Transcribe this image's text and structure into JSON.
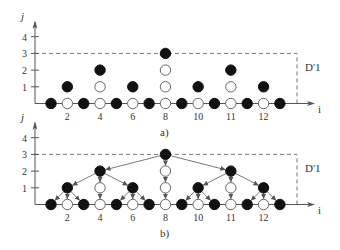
{
  "figure": {
    "panels": [
      {
        "id": "a",
        "caption": "a)",
        "y_axis_label": "j",
        "x_axis_label": "i",
        "region_label": "D'1",
        "y_ticks": [
          "1",
          "2",
          "3",
          "4"
        ],
        "x_ticks": [
          {
            "col": 1,
            "label": "2"
          },
          {
            "col": 3,
            "label": "4"
          },
          {
            "col": 5,
            "label": "6"
          },
          {
            "col": 7,
            "label": "8"
          },
          {
            "col": 9,
            "label": "10"
          },
          {
            "col": 11,
            "label": "11"
          },
          {
            "col": 13,
            "label": "12"
          }
        ],
        "show_arrows": false
      },
      {
        "id": "b",
        "caption": "b)",
        "y_axis_label": "j",
        "x_axis_label": "i",
        "region_label": "D'1",
        "y_ticks": [
          "1",
          "2",
          "3",
          "4"
        ],
        "x_ticks": [
          {
            "col": 1,
            "label": "2"
          },
          {
            "col": 3,
            "label": "4"
          },
          {
            "col": 5,
            "label": "6"
          },
          {
            "col": 7,
            "label": "8"
          },
          {
            "col": 9,
            "label": "10"
          },
          {
            "col": 11,
            "label": "11"
          },
          {
            "col": 13,
            "label": "12"
          }
        ],
        "show_arrows": true
      }
    ],
    "nodes": [
      {
        "col": 0,
        "level": 0,
        "filled": true
      },
      {
        "col": 1,
        "level": 0,
        "filled": false
      },
      {
        "col": 2,
        "level": 0,
        "filled": true
      },
      {
        "col": 3,
        "level": 0,
        "filled": false
      },
      {
        "col": 4,
        "level": 0,
        "filled": true
      },
      {
        "col": 5,
        "level": 0,
        "filled": false
      },
      {
        "col": 6,
        "level": 0,
        "filled": true
      },
      {
        "col": 7,
        "level": 0,
        "filled": false
      },
      {
        "col": 8,
        "level": 0,
        "filled": true
      },
      {
        "col": 9,
        "level": 0,
        "filled": false
      },
      {
        "col": 10,
        "level": 0,
        "filled": true
      },
      {
        "col": 11,
        "level": 0,
        "filled": false
      },
      {
        "col": 12,
        "level": 0,
        "filled": true
      },
      {
        "col": 13,
        "level": 0,
        "filled": false
      },
      {
        "col": 14,
        "level": 0,
        "filled": true
      },
      {
        "col": 1,
        "level": 1,
        "filled": true
      },
      {
        "col": 3,
        "level": 1,
        "filled": false
      },
      {
        "col": 5,
        "level": 1,
        "filled": true
      },
      {
        "col": 7,
        "level": 1,
        "filled": false
      },
      {
        "col": 9,
        "level": 1,
        "filled": true
      },
      {
        "col": 11,
        "level": 1,
        "filled": false
      },
      {
        "col": 13,
        "level": 1,
        "filled": true
      },
      {
        "col": 3,
        "level": 2,
        "filled": true
      },
      {
        "col": 7,
        "level": 2,
        "filled": false
      },
      {
        "col": 11,
        "level": 2,
        "filled": true
      },
      {
        "col": 7,
        "level": 3,
        "filled": true
      }
    ],
    "edges": [
      [
        [
          7,
          3
        ],
        [
          3,
          2
        ]
      ],
      [
        [
          7,
          3
        ],
        [
          7,
          2
        ]
      ],
      [
        [
          7,
          3
        ],
        [
          11,
          2
        ]
      ],
      [
        [
          3,
          2
        ],
        [
          1,
          1
        ]
      ],
      [
        [
          3,
          2
        ],
        [
          3,
          1
        ]
      ],
      [
        [
          3,
          2
        ],
        [
          5,
          1
        ]
      ],
      [
        [
          7,
          2
        ],
        [
          7,
          1
        ]
      ],
      [
        [
          11,
          2
        ],
        [
          9,
          1
        ]
      ],
      [
        [
          11,
          2
        ],
        [
          11,
          1
        ]
      ],
      [
        [
          11,
          2
        ],
        [
          13,
          1
        ]
      ],
      [
        [
          1,
          1
        ],
        [
          0,
          0
        ]
      ],
      [
        [
          1,
          1
        ],
        [
          1,
          0
        ]
      ],
      [
        [
          1,
          1
        ],
        [
          2,
          0
        ]
      ],
      [
        [
          3,
          1
        ],
        [
          3,
          0
        ]
      ],
      [
        [
          5,
          1
        ],
        [
          4,
          0
        ]
      ],
      [
        [
          5,
          1
        ],
        [
          5,
          0
        ]
      ],
      [
        [
          5,
          1
        ],
        [
          6,
          0
        ]
      ],
      [
        [
          7,
          1
        ],
        [
          7,
          0
        ]
      ],
      [
        [
          9,
          1
        ],
        [
          8,
          0
        ]
      ],
      [
        [
          9,
          1
        ],
        [
          9,
          0
        ]
      ],
      [
        [
          9,
          1
        ],
        [
          10,
          0
        ]
      ],
      [
        [
          11,
          1
        ],
        [
          11,
          0
        ]
      ],
      [
        [
          13,
          1
        ],
        [
          12,
          0
        ]
      ],
      [
        [
          13,
          1
        ],
        [
          13,
          0
        ]
      ],
      [
        [
          13,
          1
        ],
        [
          14,
          0
        ]
      ]
    ],
    "colors": {
      "ink": "#111111",
      "axis": "#555555",
      "dash": "#777777",
      "text": "#333333",
      "arrow": "#555555"
    }
  }
}
